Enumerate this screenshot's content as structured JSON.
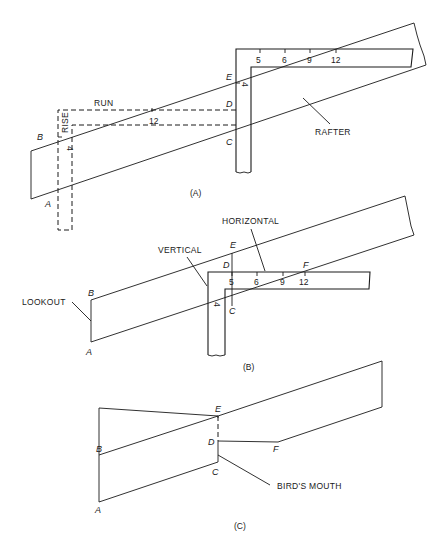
{
  "figure": {
    "panels": [
      {
        "id": "A",
        "caption": "(A)",
        "labels": {
          "run": "RUN",
          "rise": "RISE",
          "rafter": "RAFTER",
          "run_value": "12",
          "rise_value": "4",
          "tongue_value": "4"
        },
        "points": [
          "A",
          "B",
          "C",
          "D",
          "E"
        ],
        "square_ticks": [
          "5",
          "6",
          "9",
          "12"
        ]
      },
      {
        "id": "B",
        "caption": "(B)",
        "labels": {
          "lookout": "LOOKOUT",
          "vertical": "VERTICAL",
          "horizontal": "HORIZONTAL",
          "tongue_value": "4"
        },
        "points": [
          "A",
          "B",
          "C",
          "D",
          "E",
          "F"
        ],
        "square_ticks": [
          "5",
          "6",
          "9",
          "12"
        ]
      },
      {
        "id": "C",
        "caption": "(C)",
        "labels": {
          "birds_mouth": "BIRD'S MOUTH"
        },
        "points": [
          "A",
          "B",
          "C",
          "D",
          "E",
          "F"
        ]
      }
    ]
  }
}
